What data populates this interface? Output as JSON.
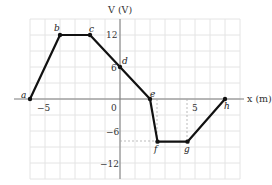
{
  "chart_data": {
    "type": "line",
    "title": "",
    "xlabel": "x (m)",
    "ylabel": "V (V)",
    "xlim": [
      -6,
      8
    ],
    "ylim": [
      -15,
      15
    ],
    "grid": true,
    "x_tick_labels": [
      "-5",
      "0",
      "5"
    ],
    "y_tick_labels": [
      "12",
      "6",
      "-6",
      "-12"
    ],
    "points": [
      {
        "label": "a",
        "x": -6,
        "y": 0
      },
      {
        "label": "b",
        "x": -4,
        "y": 12
      },
      {
        "label": "c",
        "x": -2,
        "y": 12
      },
      {
        "label": "d",
        "x": 0,
        "y": 6
      },
      {
        "label": "e",
        "x": 2,
        "y": 0
      },
      {
        "label": "f",
        "x": 2.5,
        "y": -8
      },
      {
        "label": "g",
        "x": 4.5,
        "y": -8
      },
      {
        "label": "h",
        "x": 7,
        "y": 0
      }
    ],
    "series": [
      {
        "name": "V(x)",
        "x": [
          -6,
          -4,
          -2,
          0,
          2,
          2.5,
          4.5,
          7
        ],
        "values": [
          0,
          12,
          12,
          6,
          0,
          -8,
          -8,
          0
        ]
      }
    ]
  },
  "labels": {
    "x_axis": "x (m)",
    "y_axis": "V (V)",
    "tick_x_neg5": "−5",
    "tick_x_0": "0",
    "tick_x_5": "5",
    "tick_y_12": "12",
    "tick_y_6": "6",
    "tick_y_neg6": "−6",
    "tick_y_neg12": "−12",
    "pt_a": "a",
    "pt_b": "b",
    "pt_c": "c",
    "pt_d": "d",
    "pt_e": "e",
    "pt_f": "f",
    "pt_g": "g",
    "pt_h": "h"
  }
}
